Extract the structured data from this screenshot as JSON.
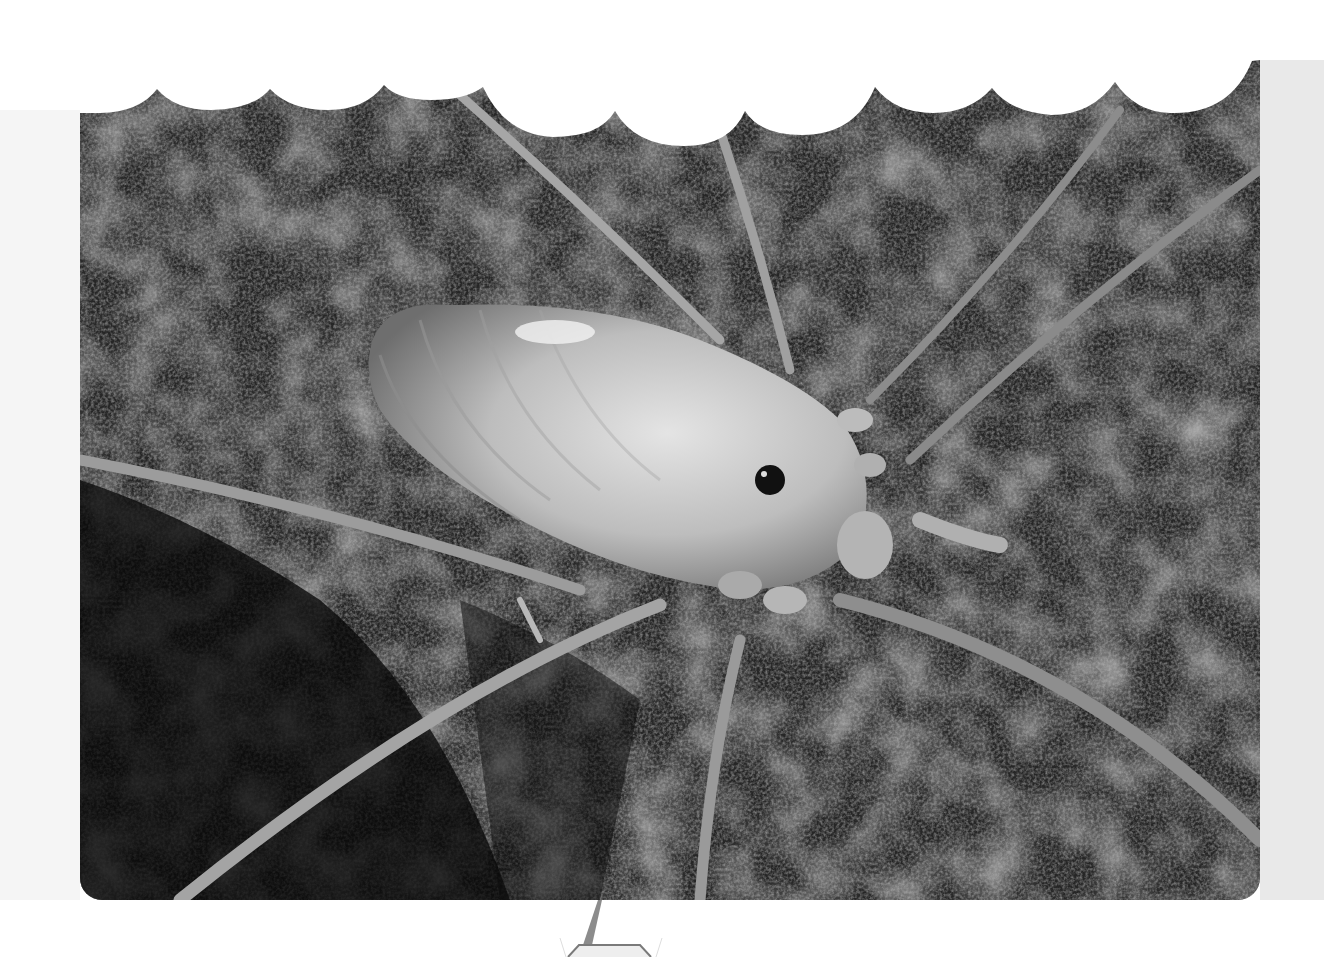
{
  "image": {
    "description": "Grayscale macro photograph of a pale harvestman (cave opilionid) with a segmented oval body, single dark eye tubercle and long thin legs, resting on dark granular rock",
    "subject": "harvestman",
    "style": "black-and-white printed photograph with scalloped (wavy) top edge and rounded bottom corners",
    "colors": {
      "page_background": "#ffffff",
      "left_margin": "#f5f5f5",
      "right_page": "#e9e9e9",
      "rock_dark": "#1a1a1a",
      "rock_mid": "#4a4a4a",
      "body_light": "#cfcfcf",
      "body_shadow": "#8a8a8a",
      "eye": "#111111",
      "leg": "#9a9a9a",
      "callout_grey": "#8c8c8c"
    }
  },
  "decorations": {
    "scalloped_edge": "top",
    "callout_pointer": "grey tapered spike below photo leading to hexagon outline"
  }
}
